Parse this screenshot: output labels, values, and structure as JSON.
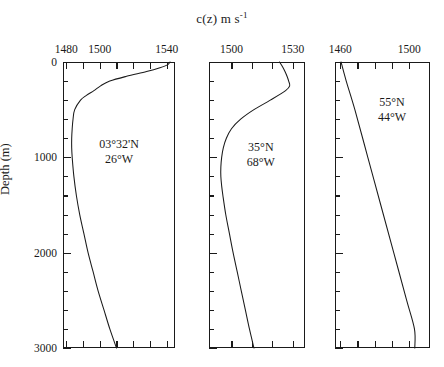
{
  "figure": {
    "title_main": "c(z) m s",
    "title_exponent": "-1",
    "y_axis_title": "Depth (m)",
    "y_ticks_labeled": [
      "0",
      "1000",
      "2000",
      "3000"
    ],
    "background_color": "#ffffff",
    "line_color": "#1a1a1a"
  },
  "chart_data": {
    "type": "line",
    "title": "c(z) m s-1",
    "xlabel": "c(z) m s-1",
    "ylabel": "Depth (m)",
    "ylim": [
      0,
      3000
    ],
    "y_inverted": true,
    "grid": false,
    "legend": "none",
    "panels": [
      {
        "id": "panel-1",
        "site_line1": "03°32'N",
        "site_line2": "26°W",
        "xlim": [
          1478,
          1545
        ],
        "xtick_labels": [
          "1480",
          "1500",
          "1540"
        ],
        "xtick_values": [
          1480,
          1500,
          1540
        ],
        "xticks_all": [
          1480,
          1490,
          1500,
          1510,
          1520,
          1530,
          1540
        ],
        "yticks_all": [
          0,
          200,
          400,
          600,
          800,
          1000,
          1200,
          1400,
          1600,
          1800,
          2000,
          2200,
          2400,
          2600,
          2800,
          3000
        ],
        "yticks_major": [
          0,
          1000,
          2000,
          3000
        ],
        "series": [
          {
            "name": "sound speed profile 03°32'N 26°W",
            "depth": [
              0,
              30,
              60,
              100,
              150,
              200,
              250,
              300,
              350,
              400,
              500,
              600,
              700,
              800,
              900,
              1000,
              1200,
              1400,
              1600,
              1800,
              2000,
              2200,
              2400,
              2600,
              2800,
              3000
            ],
            "speed": [
              1542,
              1540.5,
              1536,
              1528,
              1516,
              1506,
              1500.5,
              1496.5,
              1492,
              1488.5,
              1485,
              1484,
              1483.5,
              1483.2,
              1483.2,
              1483.5,
              1484.5,
              1486,
              1488,
              1490.5,
              1493,
              1496,
              1499,
              1502.5,
              1506,
              1510
            ]
          }
        ]
      },
      {
        "id": "panel-2",
        "site_line1": "35°N",
        "site_line2": "68°W",
        "xlim": [
          1489,
          1536
        ],
        "xtick_labels": [
          "1500",
          "1530"
        ],
        "xtick_values": [
          1500,
          1530
        ],
        "xticks_all": [
          1500,
          1510,
          1520,
          1530
        ],
        "yticks_all": [
          0,
          200,
          400,
          600,
          800,
          1000,
          1200,
          1400,
          1600,
          1800,
          2000,
          2200,
          2400,
          2600,
          2800,
          3000
        ],
        "yticks_major": [
          0,
          1000,
          2000,
          3000
        ],
        "series": [
          {
            "name": "sound speed profile 35°N 68°W",
            "depth": [
              0,
              50,
              100,
              150,
              200,
              250,
              300,
              400,
              500,
              600,
              700,
              800,
              900,
              1000,
              1100,
              1200,
              1300,
              1400,
              1600,
              1800,
              2000,
              2200,
              2400,
              2600,
              2800,
              3000
            ],
            "speed": [
              1523.5,
              1525,
              1526.2,
              1527.2,
              1528,
              1528.5,
              1526.5,
              1519,
              1511,
              1504.5,
              1500,
              1497.5,
              1496,
              1495.2,
              1494.8,
              1494.8,
              1495.2,
              1495.8,
              1497.2,
              1499,
              1500.8,
              1502.8,
              1504.8,
              1506.8,
              1508.8,
              1511
            ]
          }
        ]
      },
      {
        "id": "panel-3",
        "site_line1": "55°N",
        "site_line2": "44°W",
        "xlim": [
          1457,
          1512
        ],
        "xtick_labels": [
          "1460",
          "1500"
        ],
        "xtick_values": [
          1460,
          1500
        ],
        "xticks_all": [
          1460,
          1470,
          1480,
          1490,
          1500
        ],
        "yticks_all": [
          0,
          200,
          400,
          600,
          800,
          1000,
          1200,
          1400,
          1600,
          1800,
          2000,
          2200,
          2400,
          2600,
          2800,
          3000
        ],
        "yticks_major": [
          0,
          1000,
          2000,
          3000
        ],
        "series": [
          {
            "name": "sound speed profile 55°N 44°W",
            "depth": [
              0,
              200,
              500,
              1000,
              1500,
              2000,
              2500,
              2800,
              3000
            ],
            "speed": [
              1460.5,
              1463.5,
              1468.5,
              1476,
              1483.5,
              1491,
              1498.5,
              1503,
              1503.2
            ]
          }
        ]
      }
    ]
  }
}
